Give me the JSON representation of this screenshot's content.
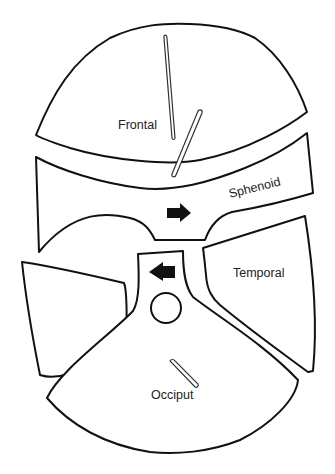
{
  "diagram": {
    "type": "cranial bone sutures schematic",
    "bones": [
      {
        "id": "frontal",
        "label": "Frontal"
      },
      {
        "id": "sphenoid",
        "label": "Sphenoid"
      },
      {
        "id": "temporal",
        "label": "Temporal"
      },
      {
        "id": "occiput",
        "label": "Occiput"
      }
    ],
    "markers": {
      "sphenoid_arrow": "arrow-right",
      "center_arrow": "arrow-left",
      "center_circle": "circle",
      "frontal_pins": [
        "long thin pin",
        "diagonal pin crossing frontal-sphenoid gap"
      ],
      "occiput_pin": "short diagonal pin"
    },
    "colors": {
      "stroke": "#111111",
      "background": "#ffffff"
    }
  }
}
